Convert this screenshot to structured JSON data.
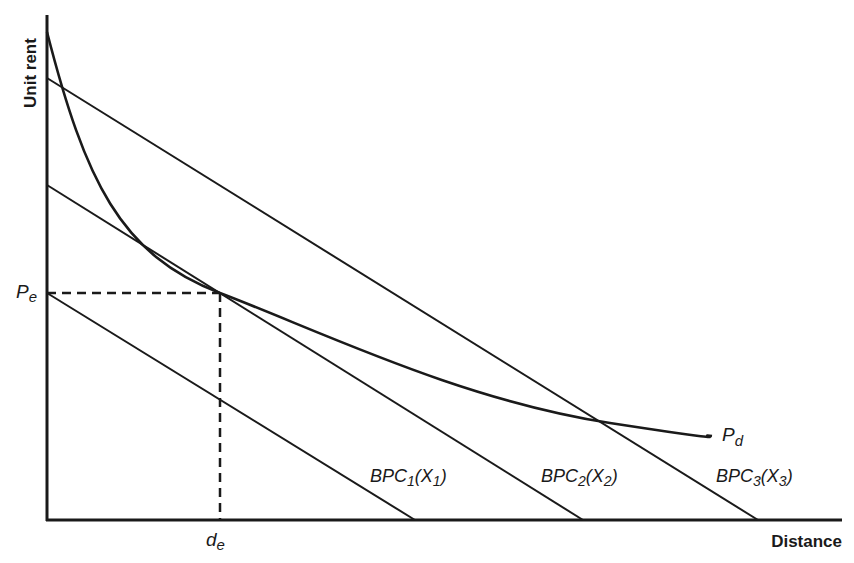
{
  "diagram": {
    "axes": {
      "y_label": "Unit rent",
      "x_label": "Distance"
    },
    "equilibrium": {
      "price_label_main": "P",
      "price_label_sub": "e",
      "distance_label_main": "d",
      "distance_label_sub": "e"
    },
    "demand_curve": {
      "label_main": "P",
      "label_sub": "d"
    },
    "bid_price_curves": [
      {
        "name": "BPC",
        "index": "1",
        "arg": "X",
        "arg_index": "1"
      },
      {
        "name": "BPC",
        "index": "2",
        "arg": "X",
        "arg_index": "2"
      },
      {
        "name": "BPC",
        "index": "3",
        "arg": "X",
        "arg_index": "3"
      }
    ],
    "colors": {
      "ink": "#1a1a1a",
      "background": "#ffffff"
    }
  }
}
